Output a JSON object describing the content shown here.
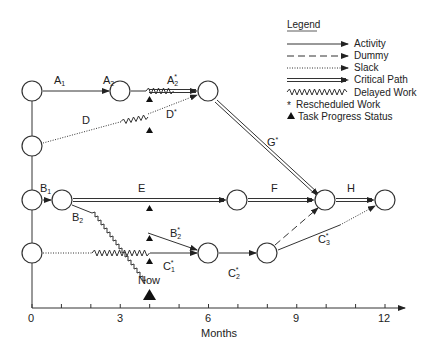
{
  "legend": {
    "title": "Legend",
    "items": [
      {
        "type": "activity",
        "label": "Activity"
      },
      {
        "type": "dummy",
        "label": "Dummy"
      },
      {
        "type": "slack",
        "label": "Slack"
      },
      {
        "type": "critical",
        "label": "Critical Path"
      },
      {
        "type": "delayed",
        "label": "Delayed Work"
      },
      {
        "type": "rescheduled",
        "symbol": "*",
        "label": "Rescheduled Work"
      },
      {
        "type": "status",
        "symbol": "▲",
        "label": "Task Progress Status"
      }
    ]
  },
  "axis": {
    "label": "Months",
    "min": 0,
    "max": 12,
    "tick_labels": [
      "0",
      "3",
      "6",
      "9",
      "12"
    ],
    "now_label": "Now",
    "now_month": 4
  },
  "activities": {
    "A1": {
      "name": "A",
      "sub": "1",
      "star": ""
    },
    "A2": {
      "name": "A",
      "sub": "2",
      "star": ""
    },
    "A2s": {
      "name": "A",
      "sub": "2",
      "star": "*"
    },
    "D": {
      "name": "D",
      "sub": "",
      "star": ""
    },
    "Ds": {
      "name": "D",
      "sub": "",
      "star": "*"
    },
    "G": {
      "name": "G",
      "sub": "",
      "star": "*"
    },
    "B1": {
      "name": "B",
      "sub": "1",
      "star": ""
    },
    "B2": {
      "name": "B",
      "sub": "2",
      "star": ""
    },
    "B2s": {
      "name": "B",
      "sub": "2",
      "star": "*"
    },
    "E": {
      "name": "E",
      "sub": "",
      "star": ""
    },
    "F": {
      "name": "F",
      "sub": "",
      "star": ""
    },
    "H": {
      "name": "H",
      "sub": "",
      "star": ""
    },
    "C1s": {
      "name": "C",
      "sub": "1",
      "star": "*"
    },
    "C2s": {
      "name": "C",
      "sub": "2",
      "star": "*"
    },
    "C3s": {
      "name": "C",
      "sub": "3",
      "star": "*"
    }
  }
}
